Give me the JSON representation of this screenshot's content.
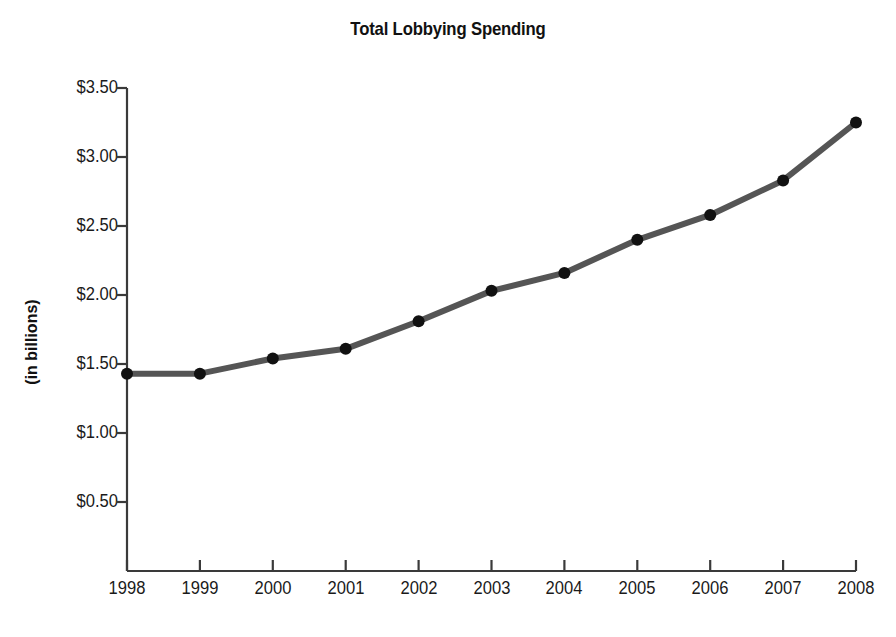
{
  "chart_data": {
    "type": "line",
    "title": "Total Lobbying Spending",
    "xlabel": "",
    "ylabel": "(in billions)",
    "categories": [
      "1998",
      "1999",
      "2000",
      "2001",
      "2002",
      "2003",
      "2004",
      "2005",
      "2006",
      "2007",
      "2008"
    ],
    "values": [
      1.43,
      1.43,
      1.54,
      1.61,
      1.81,
      2.03,
      2.16,
      2.4,
      2.58,
      2.83,
      3.25
    ],
    "ylim": [
      0.0,
      3.5
    ],
    "yticks": [
      0.5,
      1.0,
      1.5,
      2.0,
      2.5,
      3.0,
      3.5
    ],
    "ytick_labels": [
      "$0.50",
      "$1.00",
      "$1.50",
      "$2.00",
      "$2.50",
      "$3.00",
      "$3.50"
    ],
    "grid": false,
    "legend": "none",
    "series": [
      {
        "name": "Total Lobbying Spending",
        "values": [
          1.43,
          1.43,
          1.54,
          1.61,
          1.81,
          2.03,
          2.16,
          2.4,
          2.58,
          2.83,
          3.25
        ]
      }
    ],
    "line_color": "#555555",
    "marker_color": "#111111",
    "axis_color": "#3a3a3a",
    "background_color": "#ffffff"
  }
}
